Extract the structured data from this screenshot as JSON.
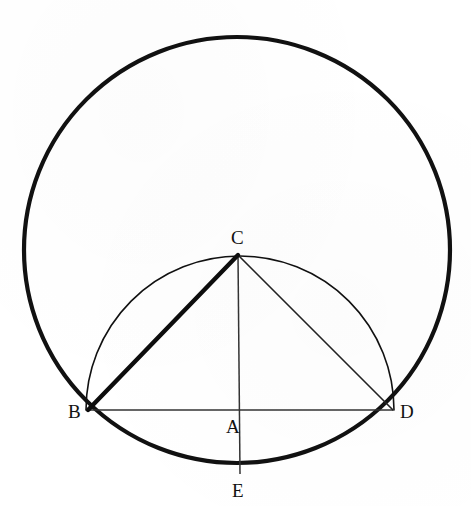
{
  "figure": {
    "background_color": "#ffffff",
    "stroke_color": "#111111",
    "width": 471,
    "height": 506
  },
  "labels": {
    "a": "A",
    "b": "B",
    "c": "C",
    "d": "D",
    "e": "E"
  },
  "chart_data": {
    "type": "diagram",
    "points": [
      {
        "name": "A",
        "x": 240,
        "y": 410,
        "role": "center-of-semicircle",
        "label_x": 226,
        "label_y": 417
      },
      {
        "name": "B",
        "x": 88,
        "y": 410,
        "role": "left-endpoint-of-chord",
        "label_x": 68,
        "label_y": 402
      },
      {
        "name": "C",
        "x": 238,
        "y": 255,
        "role": "apex-on-semicircle",
        "label_x": 231,
        "label_y": 228
      },
      {
        "name": "D",
        "x": 393,
        "y": 410,
        "role": "right-endpoint-of-chord",
        "label_x": 400,
        "label_y": 402
      },
      {
        "name": "E",
        "x": 240,
        "y": 474,
        "role": "bottom-of-outer-circle",
        "label_x": 232,
        "label_y": 481
      }
    ],
    "circles": [
      {
        "name": "outer-circle",
        "cx": 237,
        "cy": 250,
        "r": 213,
        "stroke_width": 4.2,
        "stroke": "#111111",
        "fill": "none"
      }
    ],
    "arcs": [
      {
        "name": "inner-semicircle-BCD",
        "cx": 240,
        "cy": 410,
        "r": 154,
        "start_angle_deg": 180,
        "end_angle_deg": 0,
        "stroke_width": 1.6,
        "stroke": "#111111",
        "fill": "none",
        "endpoints": [
          "B",
          "D"
        ]
      }
    ],
    "segments": [
      {
        "name": "segment-BC",
        "from": "B",
        "to": "C",
        "stroke_width": 4.4,
        "emphasis": "thick"
      },
      {
        "name": "segment-CD",
        "from": "C",
        "to": "D",
        "stroke_width": 1.6,
        "emphasis": "thin"
      },
      {
        "name": "segment-BD",
        "from": "B",
        "to": "D",
        "stroke_width": 1.5,
        "emphasis": "thin"
      },
      {
        "name": "segment-CE",
        "from": "C",
        "to": "E",
        "stroke_width": 1.5,
        "emphasis": "thin"
      }
    ]
  }
}
